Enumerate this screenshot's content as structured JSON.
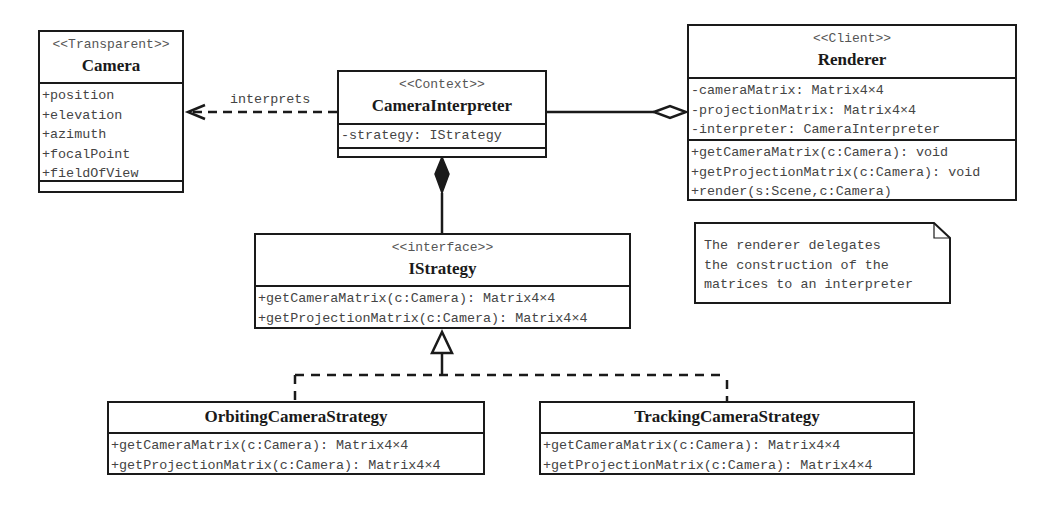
{
  "diagram": {
    "type": "UML class diagram",
    "classes": {
      "camera": {
        "stereotype": "<<Transparent>>",
        "name": "Camera",
        "attributes": [
          "+position",
          "+elevation",
          "+azimuth",
          "+focalPoint",
          "+fieldOfView"
        ],
        "methods": []
      },
      "interpreter": {
        "stereotype": "<<Context>>",
        "name": "CameraInterpreter",
        "attributes": [
          "-strategy: IStrategy"
        ],
        "methods": []
      },
      "renderer": {
        "stereotype": "<<Client>>",
        "name": "Renderer",
        "attributes": [
          "-cameraMatrix: Matrix4×4",
          "-projectionMatrix: Matrix4×4",
          "-interpreter: CameraInterpreter"
        ],
        "methods": [
          "+getCameraMatrix(c:Camera): void",
          "+getProjectionMatrix(c:Camera): void",
          "+render(s:Scene,c:Camera)"
        ]
      },
      "istrategy": {
        "stereotype": "<<interface>>",
        "name": "IStrategy",
        "methods": [
          "+getCameraMatrix(c:Camera): Matrix4×4",
          "+getProjectionMatrix(c:Camera): Matrix4×4"
        ]
      },
      "orbiting": {
        "name": "OrbitingCameraStrategy",
        "methods": [
          "+getCameraMatrix(c:Camera): Matrix4×4",
          "+getProjectionMatrix(c:Camera): Matrix4×4"
        ]
      },
      "tracking": {
        "name": "TrackingCameraStrategy",
        "methods": [
          "+getCameraMatrix(c:Camera): Matrix4×4",
          "+getProjectionMatrix(c:Camera): Matrix4×4"
        ]
      }
    },
    "relations": {
      "interprets_label": "interprets"
    },
    "note": {
      "lines": [
        "The renderer delegates",
        "the construction of the",
        "matrices to an interpreter"
      ]
    },
    "colors": {
      "line": "#1a1a1a",
      "text": "#444444",
      "stereotype": "#555555"
    }
  }
}
